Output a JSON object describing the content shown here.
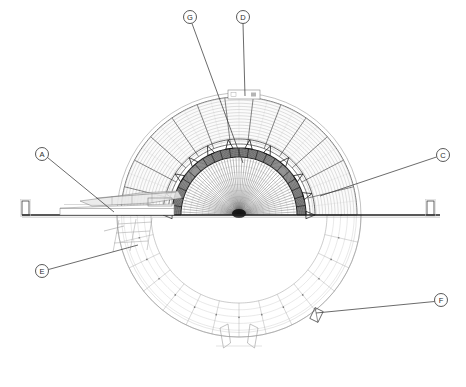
{
  "drawing": {
    "title": "Dome Structure Cross-Section",
    "type": "architectural-section",
    "canvas": {
      "width": 466,
      "height": 387
    },
    "colors": {
      "background": "#ffffff",
      "line_dark": "#1a1a1a",
      "line_mid": "#555555",
      "line_light": "#9a9a9a",
      "line_faint": "#c4c4c4",
      "callout_stroke": "#3a3a3a",
      "text": "#2b2b2b"
    },
    "geometry": {
      "center_x": 239,
      "center_y": 215,
      "outer_circle_radius": 122,
      "outer_dome_radius": 118,
      "inner_dome_outer_radius": 67,
      "inner_dome_inner_radius": 58,
      "ground_line_y": 215,
      "ground_line_x1": 22,
      "ground_line_x2": 440,
      "outer_rib_count": 13,
      "outer_arc_count": 15,
      "inner_radial_count": 60,
      "lower_ring_arc_count": 5
    }
  },
  "callouts": [
    {
      "id": "G",
      "label": "G",
      "bubble": {
        "x": 190,
        "y": 17,
        "r": 6.5
      },
      "leader": {
        "x1": 192,
        "y1": 23.5,
        "x2": 243,
        "y2": 163
      },
      "target": "inner-dome-crown"
    },
    {
      "id": "D",
      "label": "D",
      "bubble": {
        "x": 243,
        "y": 17,
        "r": 6.5
      },
      "leader": {
        "x1": 243,
        "y1": 23.5,
        "x2": 245,
        "y2": 96
      },
      "target": "outer-dome-apex-panel"
    },
    {
      "id": "A",
      "label": "A",
      "bubble": {
        "x": 42,
        "y": 154,
        "r": 6.5
      },
      "leader": {
        "x1": 47.5,
        "y1": 157.5,
        "x2": 114,
        "y2": 212
      },
      "target": "left-canopy-platform"
    },
    {
      "id": "C",
      "label": "C",
      "bubble": {
        "x": 443,
        "y": 155,
        "r": 6.5
      },
      "leader": {
        "x1": 436.5,
        "y1": 157,
        "x2": 320,
        "y2": 196
      },
      "target": "inner-dome-springing-right"
    },
    {
      "id": "E",
      "label": "E",
      "bubble": {
        "x": 42,
        "y": 271,
        "r": 6.5
      },
      "leader": {
        "x1": 48.5,
        "y1": 269.5,
        "x2": 138,
        "y2": 245
      },
      "target": "lower-left-ring-segment"
    },
    {
      "id": "F",
      "label": "F",
      "bubble": {
        "x": 441,
        "y": 300,
        "r": 6.5
      },
      "leader": {
        "x1": 434.5,
        "y1": 301.5,
        "x2": 316,
        "y2": 313
      },
      "target": "lower-right-node-detail"
    }
  ],
  "annotations": {
    "apex_panel": {
      "x": 228,
      "y": 90,
      "width": 32,
      "height": 9
    },
    "left_bracket": {
      "x": 22,
      "y": 201,
      "width": 7,
      "height": 14
    },
    "right_bracket": {
      "x": 427,
      "y": 201,
      "width": 7,
      "height": 14
    },
    "foot_left": {
      "x": 228,
      "y": 337
    },
    "foot_right": {
      "x": 250,
      "y": 337
    },
    "node_detail_f": {
      "x": 312,
      "y": 309,
      "width": 9,
      "height": 12
    }
  }
}
